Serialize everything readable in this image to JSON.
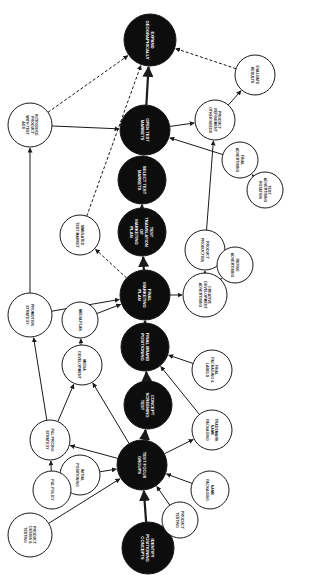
{
  "diagram": {
    "type": "flowchart",
    "orientation": "rotated-90",
    "main_nodes": [
      {
        "id": "m1",
        "label": "IDENTIFY POSITIONING CONCEPTS",
        "x": 148,
        "y": 548,
        "r": 26
      },
      {
        "id": "m2",
        "label": "TEST FOCUS GROUPS",
        "x": 142,
        "y": 465,
        "r": 25
      },
      {
        "id": "m3",
        "label": "CONCEPT SCREENING TEST",
        "x": 148,
        "y": 405,
        "r": 24
      },
      {
        "id": "m4",
        "label": "FINAL BRAND POSITIONING",
        "x": 145,
        "y": 347,
        "r": 24
      },
      {
        "id": "m5",
        "label": "FINAL MARKETING PLAN",
        "x": 145,
        "y": 295,
        "r": 25
      },
      {
        "id": "m6",
        "label": "TEST TRANSLATION OF MARKETING PLAN",
        "x": 142,
        "y": 232,
        "r": 24
      },
      {
        "id": "m7",
        "label": "SELECT TEST MARKETS",
        "x": 142,
        "y": 180,
        "r": 24
      },
      {
        "id": "m8",
        "label": "OPEN TEST MARKETS",
        "x": 145,
        "y": 130,
        "r": 25
      },
      {
        "id": "m9",
        "label": "EXPAND GEOGRAPHICALLY",
        "x": 150,
        "y": 40,
        "r": 26
      }
    ],
    "side_nodes": [
      {
        "id": "s1",
        "label": "PRODUCT DESIGN & TESTING",
        "x": 30,
        "y": 535,
        "r": 22
      },
      {
        "id": "s2",
        "label": "INITIAL POSITIONING",
        "x": 80,
        "y": 475,
        "r": 20
      },
      {
        "id": "s3",
        "label": "P&L POLICY",
        "x": 52,
        "y": 490,
        "r": 19
      },
      {
        "id": "s4",
        "label": "PRODUCT TESTING",
        "x": 180,
        "y": 520,
        "r": 18
      },
      {
        "id": "s5",
        "label": "NAME PACKAGING",
        "x": 210,
        "y": 490,
        "r": 19
      },
      {
        "id": "s6",
        "label": "TRADEMARK NAME PACKAGING",
        "x": 212,
        "y": 430,
        "r": 20
      },
      {
        "id": "s7",
        "label": "P&L PRICING STRATEGY",
        "x": 50,
        "y": 440,
        "r": 20
      },
      {
        "id": "s8",
        "label": "MEDIA DEVELOPMENT",
        "x": 82,
        "y": 365,
        "r": 20
      },
      {
        "id": "s9",
        "label": "MEDIA PLAN",
        "x": 80,
        "y": 320,
        "r": 18
      },
      {
        "id": "s10",
        "label": "FINAL PACKAGING & LABELS",
        "x": 212,
        "y": 370,
        "r": 20
      },
      {
        "id": "s11",
        "label": "PROMOTION STRATEGY",
        "x": 30,
        "y": 315,
        "r": 22
      },
      {
        "id": "s12",
        "label": "SIMULATED TEST MARKET",
        "x": 80,
        "y": 235,
        "r": 20
      },
      {
        "id": "s13",
        "label": "CREATIVE DEVELOPMENT ADVERTISING",
        "x": 205,
        "y": 295,
        "r": 22
      },
      {
        "id": "s14",
        "label": "PRODUCT PRODUCTION",
        "x": 205,
        "y": 250,
        "r": 20
      },
      {
        "id": "s15",
        "label": "REFINE ADVERTISING",
        "x": 235,
        "y": 265,
        "r": 18
      },
      {
        "id": "s16",
        "label": "FINAL ADVERTISING",
        "x": 240,
        "y": 160,
        "r": 18
      },
      {
        "id": "s17",
        "label": "TEST ADVERTISING ROTATION",
        "x": 265,
        "y": 190,
        "r": 18
      },
      {
        "id": "s18",
        "label": "PRODUCT REFINEMENT OTHER NEEDS",
        "x": 215,
        "y": 120,
        "r": 20
      },
      {
        "id": "s19",
        "label": "EVALUATE RESULTS",
        "x": 255,
        "y": 75,
        "r": 20
      },
      {
        "id": "s20",
        "label": "INTRODUCE PRODUCT WITH TEST ADS",
        "x": 30,
        "y": 125,
        "r": 22
      }
    ],
    "colors": {
      "main_fill": "#0d0d0d",
      "side_fill": "#ffffff",
      "stroke": "#1a1a1a",
      "text_main": "#ffffff",
      "text_side": "#1a1a1a"
    }
  }
}
